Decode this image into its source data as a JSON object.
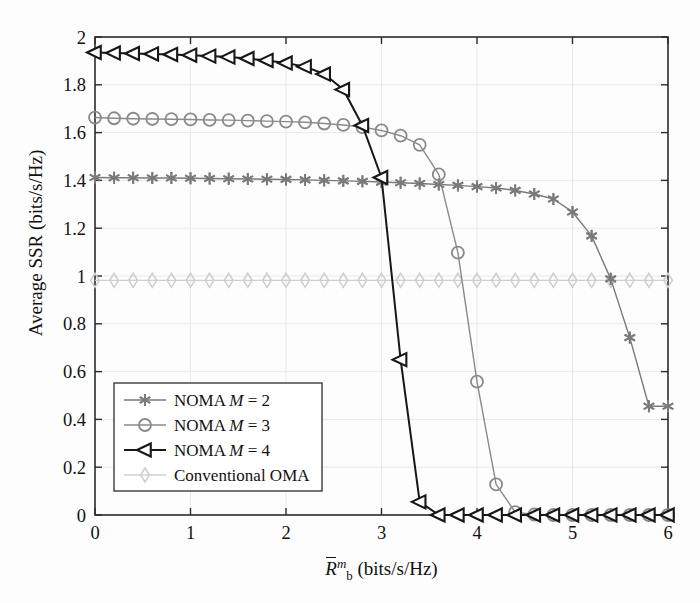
{
  "figure": {
    "background": "#fdfdfd",
    "plot_area": {
      "left": 95,
      "top": 37,
      "right": 668,
      "bottom": 515
    }
  },
  "axes": {
    "y_label": "Average SSR (bits/s/Hz)",
    "x_label_prefix": "R",
    "x_label_sup": "m",
    "x_label_sub": "b",
    "x_label_suffix": " (bits/s/Hz)",
    "x_ticks": [
      "0",
      "1",
      "2",
      "3",
      "4",
      "5",
      "6"
    ],
    "y_ticks": [
      "0",
      "0.2",
      "0.4",
      "0.6",
      "0.8",
      "1",
      "1.2",
      "1.4",
      "1.6",
      "1.8",
      "2"
    ],
    "grid": true,
    "frame_color": "#2b2b2b"
  },
  "legend": {
    "position": "lower-left",
    "border_color": "#3a3a3a",
    "background": "#ffffff",
    "items": [
      {
        "label_prefix": "NOMA ",
        "label_var": "M",
        "label_suffix": " = 2",
        "marker": "asterisk-marker",
        "color": "#7a7a7a"
      },
      {
        "label_prefix": "NOMA ",
        "label_var": "M",
        "label_suffix": " = 3",
        "marker": "circle-marker",
        "color": "#8a8a8a"
      },
      {
        "label_prefix": "NOMA ",
        "label_var": "M",
        "label_suffix": " = 4",
        "marker": "left-triangle-marker",
        "color": "#171717"
      },
      {
        "label_prefix": "Conventional OMA",
        "label_var": "",
        "label_suffix": "",
        "marker": "diamond-marker",
        "color": "#cfcfcf"
      }
    ]
  },
  "chart_data": {
    "type": "line",
    "title": "",
    "xlabel": "R̄_b^m (bits/s/Hz)",
    "ylabel": "Average SSR (bits/s/Hz)",
    "xlim": [
      0,
      6
    ],
    "ylim": [
      0,
      2
    ],
    "xticks": [
      0,
      1,
      2,
      3,
      4,
      5,
      6
    ],
    "yticks": [
      0,
      0.2,
      0.4,
      0.6,
      0.8,
      1,
      1.2,
      1.4,
      1.6,
      1.8,
      2
    ],
    "grid": true,
    "legend_position": "lower left",
    "marker_interval_x": 0.2,
    "series": [
      {
        "name": "NOMA M = 2",
        "marker": "asterisk-marker",
        "color": "#7a7a7a",
        "line_width": 1.4,
        "x": [
          0,
          0.2,
          0.4,
          0.6,
          0.8,
          1.0,
          1.2,
          1.4,
          1.6,
          1.8,
          2.0,
          2.2,
          2.4,
          2.6,
          2.8,
          3.0,
          3.2,
          3.4,
          3.6,
          3.8,
          4.0,
          4.2,
          4.4,
          4.6,
          4.8,
          5.0,
          5.2,
          5.4,
          5.6,
          5.8,
          6.0
        ],
        "y": [
          1.412,
          1.411,
          1.411,
          1.41,
          1.41,
          1.409,
          1.408,
          1.407,
          1.406,
          1.405,
          1.404,
          1.402,
          1.4,
          1.398,
          1.396,
          1.393,
          1.39,
          1.387,
          1.383,
          1.379,
          1.374,
          1.368,
          1.358,
          1.343,
          1.322,
          1.268,
          1.168,
          0.988,
          0.742,
          0.455,
          0.455
        ]
      },
      {
        "name": "NOMA M = 3",
        "marker": "circle-marker",
        "color": "#8a8a8a",
        "line_width": 1.4,
        "x": [
          0,
          0.2,
          0.4,
          0.6,
          0.8,
          1.0,
          1.2,
          1.4,
          1.6,
          1.8,
          2.0,
          2.2,
          2.4,
          2.6,
          2.8,
          3.0,
          3.2,
          3.4,
          3.6,
          3.8,
          4.0,
          4.2,
          4.4,
          4.6,
          4.8,
          5.0,
          5.2,
          5.4,
          5.6,
          5.8,
          6.0
        ],
        "y": [
          1.663,
          1.66,
          1.658,
          1.657,
          1.656,
          1.655,
          1.653,
          1.652,
          1.65,
          1.648,
          1.646,
          1.643,
          1.638,
          1.632,
          1.623,
          1.609,
          1.587,
          1.549,
          1.425,
          1.098,
          0.558,
          0.128,
          0.012,
          0.002,
          0.0,
          0.0,
          0.0,
          0.0,
          0.0,
          0.0,
          0.0
        ]
      },
      {
        "name": "NOMA M = 4",
        "marker": "left-triangle-marker",
        "color": "#171717",
        "line_width": 2.0,
        "x": [
          0,
          0.2,
          0.4,
          0.6,
          0.8,
          1.0,
          1.2,
          1.4,
          1.6,
          1.8,
          2.0,
          2.2,
          2.4,
          2.6,
          2.8,
          3.0,
          3.2,
          3.4,
          3.6,
          3.8,
          4.0,
          4.2,
          4.4,
          4.6,
          4.8,
          5.0,
          5.2,
          5.4,
          5.6,
          5.8,
          6.0
        ],
        "y": [
          1.935,
          1.933,
          1.931,
          1.929,
          1.927,
          1.924,
          1.92,
          1.916,
          1.91,
          1.902,
          1.891,
          1.876,
          1.845,
          1.78,
          1.63,
          1.412,
          0.65,
          0.055,
          0.0,
          0.0,
          0.0,
          0.0,
          0.0,
          0.0,
          0.0,
          0.0,
          0.0,
          0.0,
          0.0,
          0.0,
          0.0
        ]
      },
      {
        "name": "Conventional OMA",
        "marker": "diamond-marker",
        "color": "#cfcfcf",
        "line_width": 1.2,
        "x": [
          0,
          0.2,
          0.4,
          0.6,
          0.8,
          1.0,
          1.2,
          1.4,
          1.6,
          1.8,
          2.0,
          2.2,
          2.4,
          2.6,
          2.8,
          3.0,
          3.2,
          3.4,
          3.6,
          3.8,
          4.0,
          4.2,
          4.4,
          4.6,
          4.8,
          5.0,
          5.2,
          5.4,
          5.6,
          5.8,
          6.0
        ],
        "y": [
          0.982,
          0.982,
          0.982,
          0.982,
          0.982,
          0.982,
          0.982,
          0.982,
          0.982,
          0.982,
          0.982,
          0.982,
          0.982,
          0.982,
          0.982,
          0.982,
          0.982,
          0.982,
          0.982,
          0.982,
          0.982,
          0.982,
          0.982,
          0.982,
          0.982,
          0.982,
          0.982,
          0.982,
          0.982,
          0.982,
          0.982
        ]
      }
    ]
  }
}
